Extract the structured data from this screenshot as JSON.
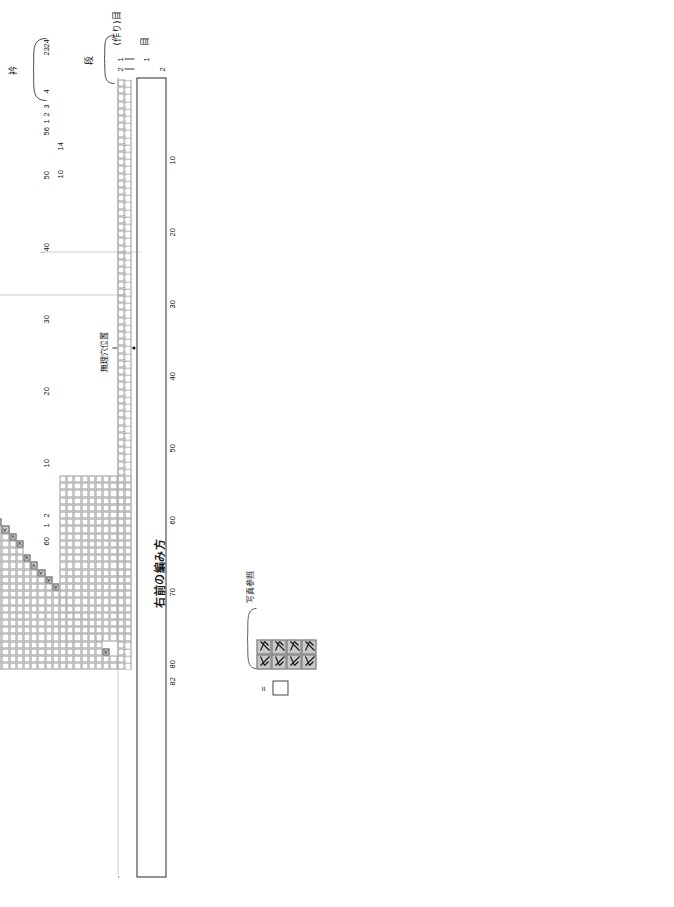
{
  "document": {
    "kind": "knitting-chart",
    "title": "右前の編み方",
    "language": "ja"
  },
  "labels": {
    "title": "右前の編み方",
    "collar": "衿",
    "photo_reference": "写真参照",
    "buttonhole_position": "無理穴位置",
    "stitch_axis": "目",
    "row_axis": "段",
    "cast_on_axis": "(作り)目",
    "equals": "="
  },
  "legend": {
    "items": [
      {
        "symbol": "blank-box",
        "glyph": "",
        "meaning": "=",
        "note": "メリヤス編み"
      },
      {
        "symbol": "left-slant-decrease",
        "glyph": "↖",
        "note": "写真参照"
      },
      {
        "symbol": "right-slant-decrease",
        "glyph": "↗",
        "note": "写真参照"
      }
    ],
    "note": "写真参照",
    "equals_label": "=",
    "decrease_rows": 4
  },
  "axes": {
    "stitch_numbers_top": [
      "24",
      "23",
      "4",
      "3",
      "2",
      "1",
      "56",
      "50",
      "40",
      "30",
      "20",
      "10",
      "2",
      "1",
      "60"
    ],
    "bottom_numbers": [
      "10",
      "20",
      "30",
      "40",
      "50",
      "60",
      "70",
      "80",
      "82"
    ],
    "side_numbers": [
      "14",
      "10"
    ],
    "row_small_numbers": [
      "2",
      "1"
    ],
    "cast_on_numbers": [
      "1",
      "2"
    ]
  },
  "chart_data": {
    "type": "table",
    "title": "右前の編み方",
    "xlabel": "目",
    "ylabel": "段",
    "total_stitches": 82,
    "total_rows": 60,
    "grid": {
      "columns": 82,
      "rows": 60,
      "cell_px": 7.2
    },
    "xticks": [
      10,
      20,
      30,
      40,
      50,
      60,
      70,
      80,
      82
    ],
    "yticks": [
      1,
      2,
      10,
      20,
      30,
      40,
      50,
      56,
      60
    ],
    "notes": [
      "右前身頃の減目配置図",
      "階段状の減目が左上から右下へ連続する",
      "衿ぐり部分は上部左に分離",
      "無理穴（ボタンホール）位置は中央下段に印"
    ]
  },
  "marks": {
    "buttonhole_dot_count": 1
  }
}
